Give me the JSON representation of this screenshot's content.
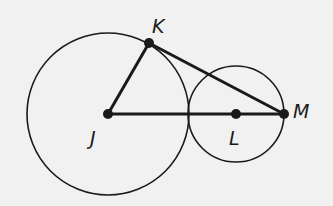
{
  "diagram": {
    "type": "geometry",
    "background": "#f1f1f1",
    "stroke_color": "#1a1a1a",
    "points": [
      {
        "id": "J",
        "label": "J",
        "x": 108,
        "y": 114,
        "lx": 90,
        "ly": 145
      },
      {
        "id": "K",
        "label": "K",
        "x": 149,
        "y": 43,
        "lx": 152,
        "ly": 33
      },
      {
        "id": "L",
        "label": "L",
        "x": 236,
        "y": 114,
        "lx": 229,
        "ly": 145
      },
      {
        "id": "M",
        "label": "M",
        "x": 284,
        "y": 114,
        "lx": 293,
        "ly": 118
      }
    ],
    "circles": [
      {
        "center": "J",
        "radius": 81
      },
      {
        "center": "L",
        "radius": 48
      }
    ],
    "segments": [
      {
        "from": "J",
        "to": "K"
      },
      {
        "from": "K",
        "to": "M"
      },
      {
        "from": "J",
        "to": "M"
      }
    ],
    "labels": {
      "J": "J",
      "K": "K",
      "L": "L",
      "M": "M"
    }
  }
}
